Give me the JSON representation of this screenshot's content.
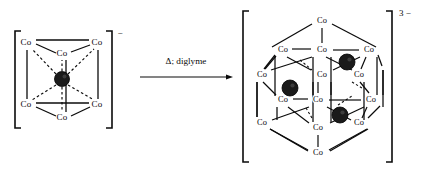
{
  "diagram": {
    "type": "chemical-reaction-scheme",
    "reactant": {
      "name": "hexacobalt-cluster-anion",
      "charge_label": "−",
      "geometry": "trigonal prism with one interstitial atom",
      "vertex_label": "Co",
      "vertex_count": 6,
      "interstitial_count": 1,
      "vertices": [
        {
          "id": "co-top-left",
          "label": "Co",
          "x": 26,
          "y": 43
        },
        {
          "id": "co-top-right",
          "label": "Co",
          "x": 97,
          "y": 43
        },
        {
          "id": "co-top-back",
          "label": "Co",
          "x": 62,
          "y": 54
        },
        {
          "id": "co-bot-left",
          "label": "Co",
          "x": 26,
          "y": 105
        },
        {
          "id": "co-bot-right",
          "label": "Co",
          "x": 97,
          "y": 105
        },
        {
          "id": "co-bot-front",
          "label": "Co",
          "x": 62,
          "y": 118
        }
      ],
      "interstitial": [
        {
          "id": "centre-atom",
          "x": 62,
          "y": 79,
          "r": 7.5
        }
      ]
    },
    "arrow": {
      "name": "reaction-arrow",
      "condition_text": "Δ; diglyme",
      "x_start": 140,
      "x_end": 233,
      "y": 77
    },
    "product": {
      "name": "tridecacobalt-cluster-trianion",
      "charge_label": "3 −",
      "geometry": "condensed polyhedron with three interstitial atoms",
      "vertex_label": "Co",
      "vertex_count": 14,
      "interstitial_count": 3,
      "vertices": [
        {
          "id": "co-apex-top",
          "label": "Co",
          "x": 322,
          "y": 21
        },
        {
          "id": "co-upper-left",
          "label": "Co",
          "x": 283,
          "y": 50
        },
        {
          "id": "co-upper-mid",
          "label": "Co",
          "x": 322,
          "y": 50
        },
        {
          "id": "co-upper-right",
          "label": "Co",
          "x": 369,
          "y": 50
        },
        {
          "id": "co-mid-far-left",
          "label": "Co",
          "x": 262,
          "y": 75
        },
        {
          "id": "co-mid-centre",
          "label": "Co",
          "x": 322,
          "y": 75
        },
        {
          "id": "co-mid-right",
          "label": "Co",
          "x": 359,
          "y": 75
        },
        {
          "id": "co-low-left",
          "label": "Co",
          "x": 283,
          "y": 100
        },
        {
          "id": "co-low-centre",
          "label": "Co",
          "x": 318,
          "y": 100
        },
        {
          "id": "co-low-right",
          "label": "Co",
          "x": 371,
          "y": 100
        },
        {
          "id": "co-base-left",
          "label": "Co",
          "x": 262,
          "y": 123
        },
        {
          "id": "co-base-mid",
          "label": "Co",
          "x": 318,
          "y": 128
        },
        {
          "id": "co-base-right",
          "label": "Co",
          "x": 359,
          "y": 123
        },
        {
          "id": "co-apex-bottom",
          "label": "Co",
          "x": 318,
          "y": 153
        }
      ],
      "interstitial": [
        {
          "id": "interstitial-upper-right",
          "x": 347,
          "y": 62,
          "r": 8
        },
        {
          "id": "interstitial-left",
          "x": 290,
          "y": 88,
          "r": 8
        },
        {
          "id": "interstitial-lower",
          "x": 340,
          "y": 115,
          "r": 8
        }
      ]
    },
    "brackets": {
      "reactant_left_x": 15,
      "reactant_right_x": 112,
      "reactant_top_y": 31,
      "reactant_bottom_y": 128,
      "product_left_x": 243,
      "product_right_x": 392,
      "product_top_y": 11,
      "product_bottom_y": 162
    },
    "colors": {
      "line": "#0b0b0b",
      "interstitial_fill": "#1a1a1a",
      "background": "#ffffff",
      "text": "#0b0b0b"
    }
  }
}
